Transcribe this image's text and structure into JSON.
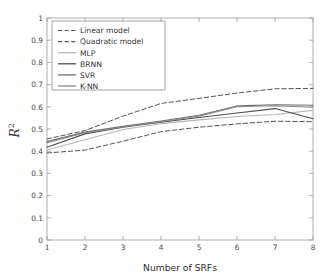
{
  "chart_data": {
    "type": "line",
    "title": "",
    "xlabel": "Number of SRFs",
    "ylabel": "R²",
    "ylabel_base": "R",
    "ylabel_exponent": "2",
    "x": [
      1,
      2,
      3,
      4,
      5,
      6,
      7,
      8
    ],
    "xlim": [
      1,
      8
    ],
    "ylim": [
      0,
      1
    ],
    "xticks": [
      "1",
      "2",
      "3",
      "4",
      "5",
      "6",
      "7",
      "8"
    ],
    "yticks": [
      "0",
      "0.1",
      "0.2",
      "0.3",
      "0.4",
      "0.5",
      "0.6",
      "0.7",
      "0.8",
      "0.9",
      "1"
    ],
    "grid": false,
    "legend_position": "upper-left",
    "series": [
      {
        "name": "Linear model",
        "style": "dashed",
        "color": "#555555",
        "values": [
          0.392,
          0.405,
          0.445,
          0.488,
          0.508,
          0.523,
          0.535,
          0.533
        ]
      },
      {
        "name": "Quadratic model",
        "style": "dashed",
        "color": "#555555",
        "values": [
          0.455,
          0.493,
          0.558,
          0.615,
          0.638,
          0.662,
          0.681,
          0.683
        ]
      },
      {
        "name": "MLP",
        "style": "solid",
        "color": "#b6b6b6",
        "values": [
          0.405,
          0.452,
          0.498,
          0.524,
          0.541,
          0.556,
          0.565,
          0.584
        ]
      },
      {
        "name": "BRNN",
        "style": "solid",
        "color": "#4e4e4e",
        "values": [
          0.418,
          0.478,
          0.508,
          0.531,
          0.552,
          0.572,
          0.592,
          0.546
        ]
      },
      {
        "name": "SVR",
        "style": "solid",
        "color": "#6e6e6e",
        "values": [
          0.443,
          0.486,
          0.512,
          0.536,
          0.562,
          0.604,
          0.609,
          0.607
        ]
      },
      {
        "name": "K-NN",
        "style": "solid",
        "color": "#8a8a8a",
        "values": [
          0.438,
          0.483,
          0.509,
          0.533,
          0.558,
          0.6,
          0.605,
          0.598
        ]
      }
    ]
  },
  "figure": {
    "background": "#ffffff",
    "frame_color": "#9a9a9a"
  }
}
